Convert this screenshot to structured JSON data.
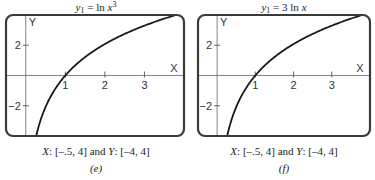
{
  "chart_data": [
    {
      "type": "line",
      "panel_label": "(e)",
      "title": "y1 = ln x^3",
      "title_parts": {
        "lhs": "y",
        "sub": "1",
        "eq": " = ln ",
        "var": "x",
        "sup": "3"
      },
      "function": "3*ln(x)",
      "xlim": [
        -0.5,
        4
      ],
      "ylim": [
        -4,
        4
      ],
      "xticks": [
        1,
        2,
        3
      ],
      "xtick_labels": [
        "1",
        "2",
        "3"
      ],
      "yticks": [
        2,
        -2
      ],
      "ytick_labels": [
        "2",
        "−2"
      ],
      "xlabel": "X",
      "ylabel": "Y",
      "caption": {
        "x": "X",
        "xrange": ": [–.5, 4] and ",
        "y": "Y",
        "yrange": ": [–4, 4]"
      },
      "grid": false
    },
    {
      "type": "line",
      "panel_label": "(f)",
      "title": "y1 = 3 ln x",
      "title_parts": {
        "lhs": "y",
        "sub": "1",
        "eq": " = 3 ln ",
        "var": "x",
        "sup": ""
      },
      "function": "3*ln(x)",
      "xlim": [
        -0.5,
        4
      ],
      "ylim": [
        -4,
        4
      ],
      "xticks": [
        1,
        2,
        3
      ],
      "xtick_labels": [
        "1",
        "2",
        "3"
      ],
      "yticks": [
        2,
        -2
      ],
      "ytick_labels": [
        "2",
        "−2"
      ],
      "xlabel": "X",
      "ylabel": "Y",
      "caption": {
        "x": "X",
        "xrange": ": [–.5, 4] and ",
        "y": "Y",
        "yrange": ": [–4, 4]"
      },
      "grid": false
    }
  ]
}
